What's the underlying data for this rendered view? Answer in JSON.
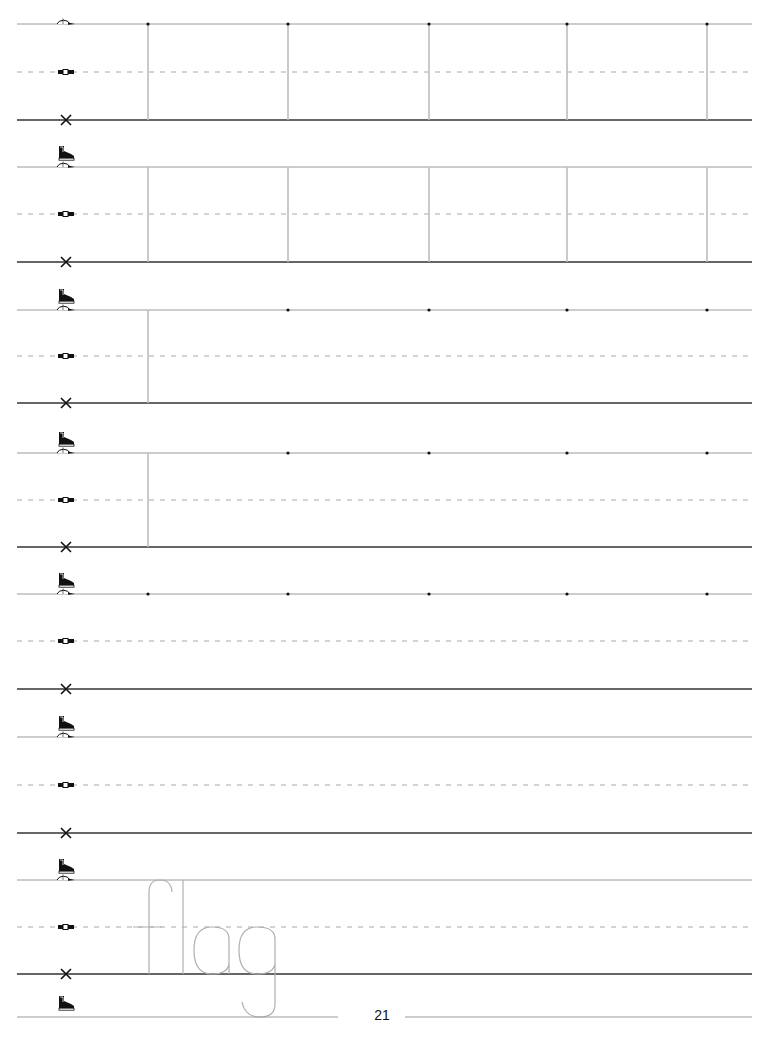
{
  "page": {
    "type": "handwriting practice sheet",
    "page_number": "21",
    "line_left_x": 17,
    "line_right_x": 752
  },
  "colors": {
    "top_line": "#9a9a9a",
    "mid_dashed": "#a8a8a8",
    "baseline": "#333333",
    "guide_vertical": "#bdbdbd",
    "dot": "#111111",
    "trace_letters": "#b0b0b0",
    "icon": "#111111"
  },
  "guide_icons": {
    "top": "cap-icon",
    "middle": "belt-icon",
    "base": "x-icon",
    "descender": "shoe-icon",
    "icon_x": 66
  },
  "rows": [
    {
      "top": 24,
      "mid": 72,
      "base": 120,
      "verticals": [
        148,
        288,
        429,
        567,
        707
      ],
      "dots": [
        148,
        288,
        429,
        567,
        707
      ]
    },
    {
      "top": 167,
      "mid": 214,
      "base": 262,
      "verticals": [
        148,
        288,
        429,
        567,
        707
      ],
      "dots": []
    },
    {
      "top": 310,
      "mid": 356,
      "base": 403,
      "verticals": [
        148
      ],
      "dots": [
        288,
        429,
        567,
        707
      ]
    },
    {
      "top": 453,
      "mid": 500,
      "base": 547,
      "verticals": [
        148
      ],
      "dots": [
        288,
        429,
        567,
        707
      ]
    },
    {
      "top": 594,
      "mid": 641,
      "base": 689,
      "verticals": [],
      "dots": [
        148,
        288,
        429,
        567,
        707
      ]
    },
    {
      "top": 737,
      "mid": 785,
      "base": 833,
      "verticals": [],
      "dots": []
    },
    {
      "top": 880,
      "mid": 927,
      "base": 974,
      "verticals": [],
      "dots": [],
      "trace_word": "flag"
    }
  ],
  "bottom_line": {
    "y": 1017,
    "gap_from": 338,
    "gap_to": 405
  },
  "trace_word": "flag"
}
